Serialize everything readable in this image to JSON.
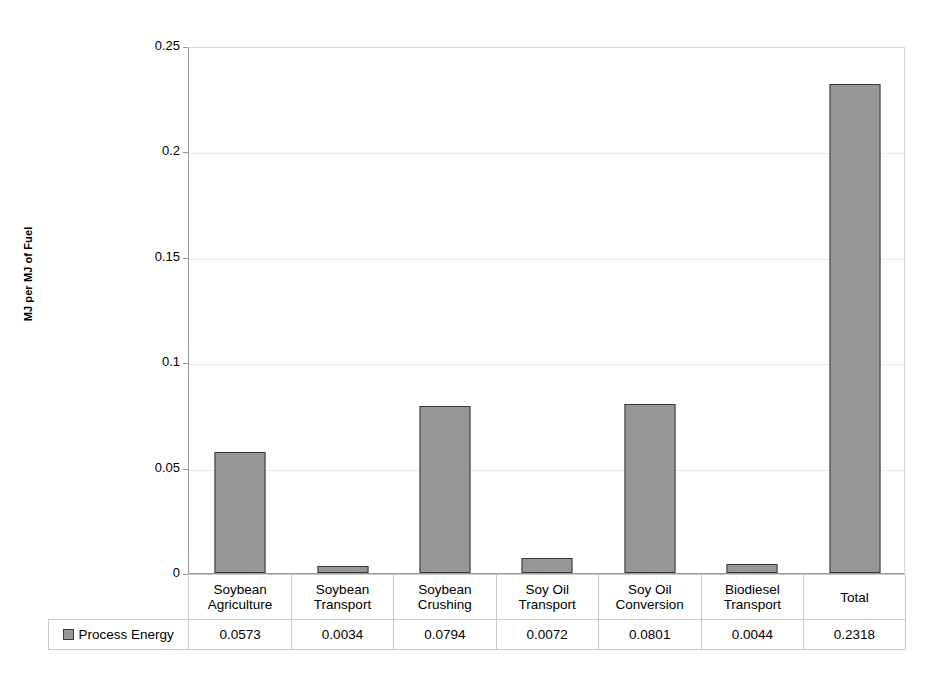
{
  "chart_data": {
    "type": "bar",
    "title": "",
    "xlabel": "",
    "ylabel": "MJ per MJ of Fuel",
    "ylim": [
      0,
      0.25
    ],
    "yticks": [
      "0",
      "0.05",
      "0.1",
      "0.15",
      "0.2",
      "0.25"
    ],
    "ytick_values": [
      0,
      0.05,
      0.1,
      0.15,
      0.2,
      0.25
    ],
    "grid": true,
    "legend_position": "table-row",
    "categories": [
      "Soybean Agriculture",
      "Soybean Transport",
      "Soybean Crushing",
      "Soy Oil Transport",
      "Soy Oil Conversion",
      "Biodiesel Transport",
      "Total"
    ],
    "category_lines": [
      [
        "Soybean",
        "Agriculture"
      ],
      [
        "Soybean",
        "Transport"
      ],
      [
        "Soybean",
        "Crushing"
      ],
      [
        "Soy Oil",
        "Transport"
      ],
      [
        "Soy Oil",
        "Conversion"
      ],
      [
        "Biodiesel",
        "Transport"
      ],
      [
        "Total",
        ""
      ]
    ],
    "series": [
      {
        "name": "Process Energy",
        "values": [
          0.0573,
          0.0034,
          0.0794,
          0.0072,
          0.0801,
          0.0044,
          0.2318
        ],
        "value_labels": [
          "0.0573",
          "0.0034",
          "0.0794",
          "0.0072",
          "0.0801",
          "0.0044",
          "0.2318"
        ],
        "color": "#969696",
        "border_color": "#3a3a3a"
      }
    ]
  },
  "colors": {
    "bar_fill": "#969696",
    "bar_border": "#3a3a3a",
    "gridline": "#ececec",
    "axis": "#9a9a9a",
    "table_border": "#c9c9c9",
    "background": "#ffffff",
    "text": "#000000"
  },
  "legend": {
    "series_label": "Process Energy",
    "swatch_name": "process-energy-swatch"
  }
}
